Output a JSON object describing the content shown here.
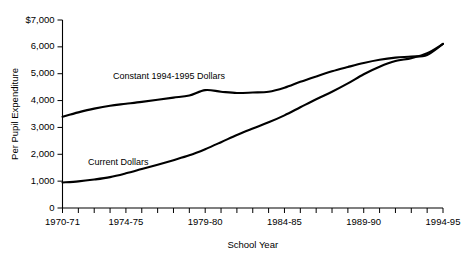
{
  "chart_data": {
    "type": "line",
    "title": "",
    "xlabel": "School Year",
    "ylabel": "Per Pupil Expenditure",
    "ylim": [
      0,
      7000
    ],
    "ytick_values": [
      0,
      1000,
      2000,
      3000,
      4000,
      5000,
      6000,
      7000
    ],
    "ytick_labels": [
      "0",
      "1,000",
      "2,000",
      "3,000",
      "4,000",
      "5,000",
      "6,000",
      "$7,000"
    ],
    "grid": false,
    "legend_position": "inline-annotation",
    "x": [
      "1970-71",
      "1971-72",
      "1972-73",
      "1973-74",
      "1974-75",
      "1975-76",
      "1976-77",
      "1977-78",
      "1978-79",
      "1979-80",
      "1980-81",
      "1981-82",
      "1982-83",
      "1983-84",
      "1984-85",
      "1985-86",
      "1986-87",
      "1987-88",
      "1988-89",
      "1989-90",
      "1990-91",
      "1991-92",
      "1992-93",
      "1993-94",
      "1994-95"
    ],
    "xtick_labels": [
      "1970-71",
      "1974-75",
      "1979-80",
      "1984-85",
      "1989-90",
      "1994-95"
    ],
    "xtick_label_indices": [
      0,
      4,
      9,
      14,
      19,
      24
    ],
    "series": [
      {
        "name": "Constant 1994-1995 Dollars",
        "annotation": "Constant 1994-1995 Dollars",
        "values": [
          3400,
          3560,
          3700,
          3810,
          3880,
          3950,
          4030,
          4110,
          4190,
          4390,
          4330,
          4280,
          4300,
          4330,
          4480,
          4700,
          4900,
          5090,
          5250,
          5400,
          5520,
          5600,
          5640,
          5700,
          6110
        ]
      },
      {
        "name": "Current Dollars",
        "annotation": "Current Dollars",
        "values": [
          950,
          990,
          1060,
          1150,
          1290,
          1450,
          1610,
          1780,
          1960,
          2190,
          2450,
          2720,
          2960,
          3190,
          3450,
          3750,
          4050,
          4330,
          4640,
          4980,
          5260,
          5470,
          5580,
          5760,
          6110
        ]
      }
    ]
  }
}
